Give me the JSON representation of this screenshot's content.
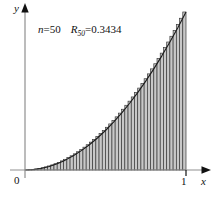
{
  "figure": {
    "name": "riemann-sum-right-endpoint-figure",
    "background_color": "#ffffff"
  },
  "annotation": {
    "n_variable": "n",
    "n_equals": "=",
    "n_value": "50",
    "r_variable": "R",
    "r_subscript": "50",
    "r_equals": "=",
    "r_value": "0.3434",
    "full_text": "n = 50   R50 = 0.3434"
  },
  "axes": {
    "y_label": "y",
    "x_label": "x",
    "origin_label": "0",
    "x_tick_label": "1",
    "axis_color": "#8a8a8a",
    "arrow_color": "#111111"
  },
  "chart_data": {
    "type": "bar",
    "title": "",
    "subtitle": "",
    "xlabel": "x",
    "ylabel": "y",
    "xlim": [
      0,
      1
    ],
    "ylim": [
      0,
      1
    ],
    "grid": false,
    "legend": false,
    "legend_position": "none",
    "n_rectangles": 50,
    "rule": "right-endpoint",
    "riemann_sum_value": 0.3434,
    "bar_fill_color": "#c8c8c8",
    "bar_edge_color": "#3a3a3a",
    "curve_color": "#1a1a1a",
    "annotations": [
      "n = 50",
      "R50 = 0.3434"
    ],
    "xticks": [
      0,
      1
    ],
    "xtick_labels": [
      "0",
      "1"
    ],
    "yticks": [],
    "ytick_labels": [],
    "x": [
      0.02,
      0.04,
      0.06,
      0.08,
      0.1,
      0.12,
      0.14,
      0.16,
      0.18,
      0.2,
      0.22,
      0.24,
      0.26,
      0.28,
      0.3,
      0.32,
      0.34,
      0.36,
      0.38,
      0.4,
      0.42,
      0.44,
      0.46,
      0.48,
      0.5,
      0.52,
      0.54,
      0.56,
      0.58,
      0.6,
      0.62,
      0.64,
      0.66,
      0.68,
      0.7,
      0.72,
      0.74,
      0.76,
      0.78,
      0.8,
      0.82,
      0.84,
      0.86,
      0.88,
      0.9,
      0.92,
      0.94,
      0.96,
      0.98,
      1.0
    ],
    "values": [
      0.0004,
      0.0016,
      0.0036,
      0.0064,
      0.01,
      0.0144,
      0.0196,
      0.0256,
      0.0324,
      0.04,
      0.0484,
      0.0576,
      0.0676,
      0.0784,
      0.09,
      0.1024,
      0.1156,
      0.1296,
      0.1444,
      0.16,
      0.1764,
      0.1936,
      0.2116,
      0.2304,
      0.25,
      0.2704,
      0.2916,
      0.3136,
      0.3364,
      0.36,
      0.3844,
      0.4096,
      0.4356,
      0.4624,
      0.49,
      0.5184,
      0.5476,
      0.5776,
      0.6084,
      0.64,
      0.6724,
      0.7056,
      0.7396,
      0.7744,
      0.81,
      0.8464,
      0.8836,
      0.9216,
      0.9604,
      1.0
    ],
    "series": [
      {
        "name": "curve",
        "equation": "y = x^2",
        "x": [
          0.0,
          0.05,
          0.1,
          0.15,
          0.2,
          0.25,
          0.3,
          0.35,
          0.4,
          0.45,
          0.5,
          0.55,
          0.6,
          0.65,
          0.7,
          0.75,
          0.8,
          0.85,
          0.9,
          0.95,
          1.0
        ],
        "values": [
          0.0,
          0.0025,
          0.01,
          0.0225,
          0.04,
          0.0625,
          0.09,
          0.1225,
          0.16,
          0.2025,
          0.25,
          0.3025,
          0.36,
          0.4225,
          0.49,
          0.5625,
          0.64,
          0.7225,
          0.81,
          0.9025,
          1.0
        ]
      }
    ]
  },
  "geometry": {
    "origin_px": {
      "x": 25,
      "y": 170
    },
    "x_one_px": 186,
    "y_top_px": 12,
    "x_axis_end_px": 209,
    "y_axis_top_px": 8
  }
}
